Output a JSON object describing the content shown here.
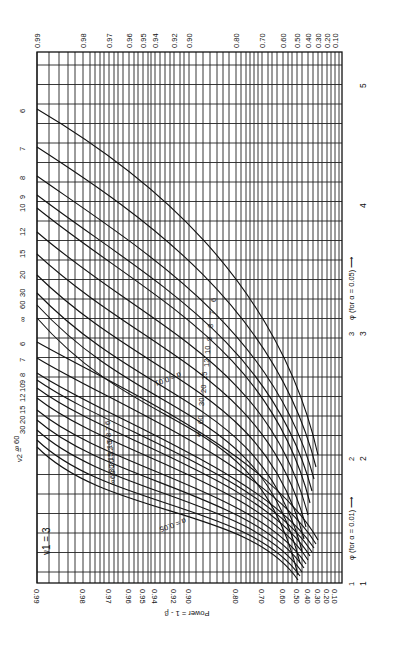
{
  "chart_data": {
    "type": "line",
    "orientation": "rotated-90",
    "nu1_label": "ν1 = 3",
    "y_axis_label": "Power = 1 - β",
    "power_ticks": [
      "0.99",
      "0.98",
      "0.97",
      "0.96",
      "0.95",
      "0.94",
      "0.92",
      "0.90",
      "0.80",
      "0.70",
      "0.60",
      "0.50",
      "0.40",
      "0.30",
      "0.20",
      "0.10"
    ],
    "x_axis_label_alpha_001": "φ (for α = 0.01) ⟶",
    "x_axis_label_alpha_005": "φ (for α = 0.05) ⟶",
    "phi_ticks_alpha_001": [
      "1",
      "2",
      "3"
    ],
    "phi_ticks_alpha_005": [
      "1",
      "2",
      "3",
      "4",
      "5"
    ],
    "nu2_label": "ν2 =",
    "series_groups": [
      {
        "name": "α = 0.05",
        "nu2_values": [
          "6",
          "7",
          "8",
          "9",
          "10",
          "12",
          "15",
          "20",
          "30",
          "60",
          "∞"
        ]
      },
      {
        "name": "α = 0.01",
        "nu2_values": [
          "6",
          "7",
          "8",
          "9",
          "10",
          "12",
          "15",
          "20",
          "30",
          "60",
          "∞"
        ]
      }
    ],
    "grid": true,
    "legend_position": "inline curve labels"
  },
  "labels": {
    "alpha_005_tag": "α = 0.05",
    "alpha_001_tag": "α = 0.01",
    "nu1": "ν1 = 3",
    "power_axis": "Power = 1 - β",
    "phi_001": "φ (for α = 0.01) ⟶",
    "phi_005": "φ (for α = 0.05) ⟶",
    "nu2_eq": "ν2 ="
  }
}
